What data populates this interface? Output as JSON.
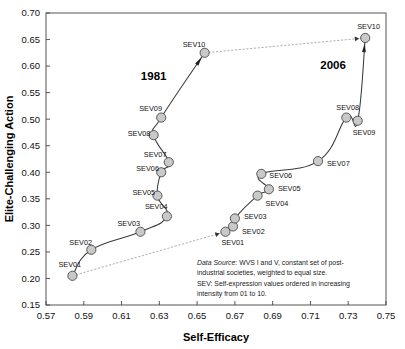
{
  "chart_data": {
    "type": "scatter",
    "title": "",
    "xlabel": "Self-Efficacy",
    "ylabel": "Elite-Challenging Action",
    "xlim": [
      0.57,
      0.75
    ],
    "ylim": [
      0.15,
      0.7
    ],
    "xticks": [
      "0.57",
      "0.59",
      "0.61",
      "0.63",
      "0.65",
      "0.67",
      "0.69",
      "0.71",
      "0.73",
      "0.75"
    ],
    "yticks": [
      "0.15",
      "0.20",
      "0.25",
      "0.30",
      "0.35",
      "0.40",
      "0.45",
      "0.50",
      "0.55",
      "0.60",
      "0.65",
      "0.70"
    ],
    "grid": false,
    "legend": "none",
    "series": [
      {
        "name": "1981",
        "points": [
          {
            "label": "SEV01",
            "x": 0.584,
            "y": 0.205
          },
          {
            "label": "SEV02",
            "x": 0.594,
            "y": 0.254
          },
          {
            "label": "SEV03",
            "x": 0.62,
            "y": 0.288
          },
          {
            "label": "SEV04",
            "x": 0.634,
            "y": 0.317
          },
          {
            "label": "SEV05",
            "x": 0.629,
            "y": 0.356
          },
          {
            "label": "SEV06",
            "x": 0.631,
            "y": 0.4
          },
          {
            "label": "SEV07",
            "x": 0.635,
            "y": 0.419
          },
          {
            "label": "SEV08",
            "x": 0.627,
            "y": 0.47
          },
          {
            "label": "SEV09",
            "x": 0.631,
            "y": 0.503
          },
          {
            "label": "SEV10",
            "x": 0.654,
            "y": 0.625
          }
        ]
      },
      {
        "name": "2006",
        "points": [
          {
            "label": "SEV01",
            "x": 0.665,
            "y": 0.288
          },
          {
            "label": "SEV02",
            "x": 0.669,
            "y": 0.298
          },
          {
            "label": "SEV03",
            "x": 0.67,
            "y": 0.313
          },
          {
            "label": "SEV04",
            "x": 0.682,
            "y": 0.356
          },
          {
            "label": "SEV05",
            "x": 0.688,
            "y": 0.368
          },
          {
            "label": "SEV06",
            "x": 0.684,
            "y": 0.397
          },
          {
            "label": "SEV07",
            "x": 0.714,
            "y": 0.421
          },
          {
            "label": "SEV08",
            "x": 0.729,
            "y": 0.503
          },
          {
            "label": "SEV09",
            "x": 0.735,
            "y": 0.497
          },
          {
            "label": "SEV10",
            "x": 0.739,
            "y": 0.653
          }
        ]
      }
    ],
    "connectors": [
      {
        "name": "sev01-1981-to-2006",
        "from": {
          "x": 0.584,
          "y": 0.205
        },
        "to": {
          "x": 0.665,
          "y": 0.288
        }
      },
      {
        "name": "sev10-1981-to-2006",
        "from": {
          "x": 0.654,
          "y": 0.625
        },
        "to": {
          "x": 0.739,
          "y": 0.653
        }
      }
    ],
    "annotations": [
      {
        "name": "era-1981",
        "text": "1981",
        "x": 0.627,
        "y": 0.573
      },
      {
        "name": "era-2006",
        "text": "2006",
        "x": 0.722,
        "y": 0.595
      }
    ]
  },
  "note": {
    "line1_em": "Data Source",
    "line1": ": WVS I and V, constant set of post-",
    "line2": "industrial societies, weighted to equal size.",
    "line3": "SEV: Self-expression values ordered in increasing",
    "line4": "intensity from 01 to 10."
  },
  "labels": {
    "marker_label_prefix": "SEV"
  }
}
